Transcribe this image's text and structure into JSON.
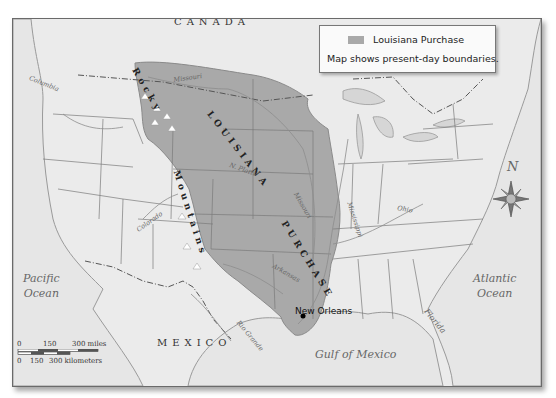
{
  "legend": {
    "swatch_label": "Louisiana Purchase",
    "note": "Map shows present-day boundaries.",
    "swatch_color": "#a9a9a9"
  },
  "labels": {
    "countries": [
      "CANADA",
      "MEXICO"
    ],
    "oceans": {
      "pacific": [
        "Pacific",
        "Ocean"
      ],
      "atlantic": [
        "Atlantic",
        "Ocean"
      ],
      "gulf": "Gulf of Mexico"
    },
    "regions": {
      "louisiana": "LOUISIANA",
      "purchase": "PURCHASE",
      "rocky": "Rocky",
      "mountains": "Mountains",
      "florida": "Florida"
    },
    "rivers": {
      "columbia": "Columbia",
      "missouri_upper": "Missouri",
      "n_platte": "N. Platte",
      "missouri_lower": "Missouri",
      "mississippi": "Mississippi",
      "ohio": "Ohio",
      "colorado": "Colorado",
      "arkansas": "Arkansas",
      "rio_grande": "Rio Grande"
    },
    "cities": {
      "new_orleans": "New Orleans"
    }
  },
  "compass": {
    "north_label": "N"
  },
  "scale": {
    "miles": [
      "0",
      "150",
      "300 miles"
    ],
    "kilometers": [
      "0",
      "150",
      "300 kilometers"
    ]
  },
  "colors": {
    "land": "#ebebeb",
    "purchase": "#a9a9a9",
    "border": "#6a6a6a",
    "water": "#e2e2e2"
  }
}
